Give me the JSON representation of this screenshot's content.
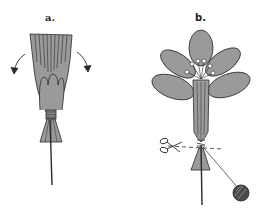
{
  "figure": {
    "panels": [
      {
        "label": "a.",
        "description": "Gathered petals bound at base with thread, arrows indicating petals to be folded outward"
      },
      {
        "label": "b.",
        "description": "Opened flower with stamens, base wrapped with thread, scissors cutting along dashed line, ball of thread"
      }
    ],
    "colors": {
      "fill": "#9a9a9a",
      "outline": "#2a2a2a",
      "background": "#ffffff"
    }
  }
}
